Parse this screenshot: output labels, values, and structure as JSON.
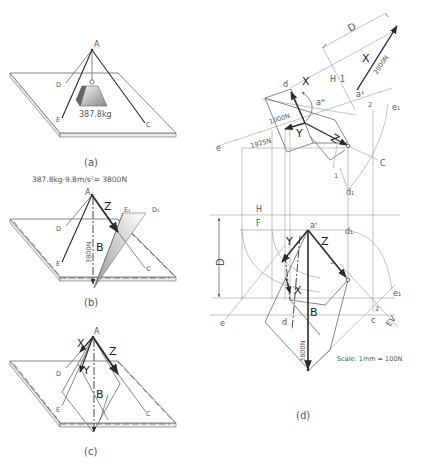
{
  "figure": {
    "panels": [
      {
        "id": "a",
        "caption": "(a)",
        "labels": {
          "apex": "A",
          "d": "D",
          "e": "E",
          "c": "C",
          "mass": "387.8kg"
        }
      },
      {
        "id": "b",
        "caption": "(b)",
        "formula": "387.8kg·9.8m/s²= 3800N",
        "labels": {
          "apex": "A",
          "z": "Z",
          "e1": "E₁",
          "d1": "D₁",
          "d": "D",
          "e": "E",
          "c": "C",
          "b": "B",
          "force": "3800N"
        }
      },
      {
        "id": "c",
        "caption": "(c)",
        "labels": {
          "apex": "A",
          "x": "X",
          "y": "Y",
          "z": "Z",
          "b": "B",
          "d": "D",
          "e": "E",
          "c": "C"
        }
      },
      {
        "id": "d",
        "caption": "(d)",
        "scale": "Scale: 1mm = 100N",
        "labels": {
          "dim_top": "D",
          "x_top": "X",
          "force_x": "2000N",
          "h_top": "H",
          "one_top": "1",
          "a1": "a¹",
          "d_top": "d",
          "x_mid": "X",
          "aH": "aᴴ",
          "two_top": "2",
          "e1_top": "e₁",
          "force_y": "1000N",
          "y_top": "Y",
          "z_top": "Z",
          "e_top": "e",
          "force_1925": "1925N",
          "c_top": "C",
          "one_mid": "1",
          "d1_top": "d₁",
          "h_fold": "H",
          "f_fold": "F",
          "aF": "aᶠ",
          "d1_bot": "d₁",
          "y_bot": "Y",
          "z_bot": "Z",
          "one_bot": "1",
          "dim_left": "D",
          "x_bot": "X",
          "e1_bot": "e₁",
          "two_bot": "2",
          "b_bot": "B",
          "e_bot": "e",
          "d_bot": "d",
          "c_bot": "c",
          "ev": "EV",
          "force_b": "3800N"
        }
      }
    ]
  }
}
